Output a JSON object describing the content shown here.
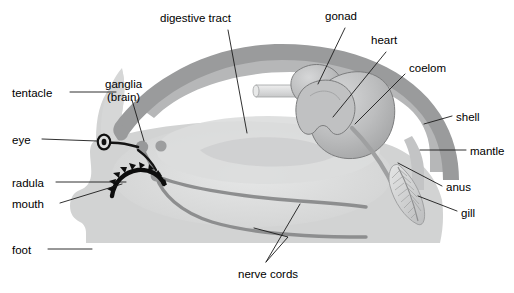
{
  "diagram": {
    "colors": {
      "body_fill": "#d2d3d3",
      "body_fill_light": "#dcdddd",
      "shell": "#9a9b9c",
      "mantle": "#b6b7b8",
      "organ_fill": "#b9babb",
      "organ_outline": "#7c7d7e",
      "nerve": "#8d8e8f",
      "digestive": "#c9cacb",
      "eye_black": "#101010",
      "radula_black": "#0d0d0d",
      "leader_line": "#1a1a1a",
      "background": "#ffffff"
    },
    "labels": [
      {
        "id": "digestive-tract",
        "text": "digestive tract",
        "x": 160,
        "y": 12,
        "align": "left"
      },
      {
        "id": "gonad",
        "text": "gonad",
        "x": 325,
        "y": 10,
        "align": "left"
      },
      {
        "id": "heart",
        "text": "heart",
        "x": 371,
        "y": 34,
        "align": "left"
      },
      {
        "id": "coelom",
        "text": "coelom",
        "x": 409,
        "y": 62,
        "align": "left"
      },
      {
        "id": "tentacle",
        "text": "tentacle",
        "x": 12,
        "y": 87,
        "align": "left"
      },
      {
        "id": "ganglia",
        "text": "ganglia",
        "x": 105,
        "y": 78,
        "align": "left"
      },
      {
        "id": "ganglia-brain",
        "text": "(brain)",
        "x": 105,
        "y": 91,
        "align": "left"
      },
      {
        "id": "shell",
        "text": "shell",
        "x": 456,
        "y": 111,
        "align": "left"
      },
      {
        "id": "eye",
        "text": "eye",
        "x": 12,
        "y": 134,
        "align": "left"
      },
      {
        "id": "mantle",
        "text": "mantle",
        "x": 470,
        "y": 145,
        "align": "left"
      },
      {
        "id": "radula",
        "text": "radula",
        "x": 12,
        "y": 177,
        "align": "left"
      },
      {
        "id": "anus",
        "text": "anus",
        "x": 446,
        "y": 181,
        "align": "left"
      },
      {
        "id": "mouth",
        "text": "mouth",
        "x": 12,
        "y": 198,
        "align": "left"
      },
      {
        "id": "gill",
        "text": "gill",
        "x": 461,
        "y": 207,
        "align": "left"
      },
      {
        "id": "foot",
        "text": "foot",
        "x": 12,
        "y": 244,
        "align": "left"
      },
      {
        "id": "nerve-cords",
        "text": "nerve cords",
        "x": 238,
        "y": 268,
        "align": "left"
      }
    ],
    "structures": [
      {
        "id": "shell",
        "name": "shell"
      },
      {
        "id": "mantle",
        "name": "mantle"
      },
      {
        "id": "body",
        "name": "body-mass"
      },
      {
        "id": "foot",
        "name": "foot"
      },
      {
        "id": "tentacle",
        "name": "tentacle"
      },
      {
        "id": "eye",
        "name": "eye"
      },
      {
        "id": "radula",
        "name": "radula"
      },
      {
        "id": "mouth",
        "name": "mouth"
      },
      {
        "id": "ganglia",
        "name": "ganglia-brain"
      },
      {
        "id": "nerve-cords",
        "name": "nerve-cords"
      },
      {
        "id": "digestive-tract",
        "name": "digestive-tract"
      },
      {
        "id": "gonad",
        "name": "gonad"
      },
      {
        "id": "heart",
        "name": "heart"
      },
      {
        "id": "coelom",
        "name": "coelom"
      },
      {
        "id": "gill",
        "name": "gill"
      },
      {
        "id": "anus",
        "name": "anus"
      }
    ]
  }
}
